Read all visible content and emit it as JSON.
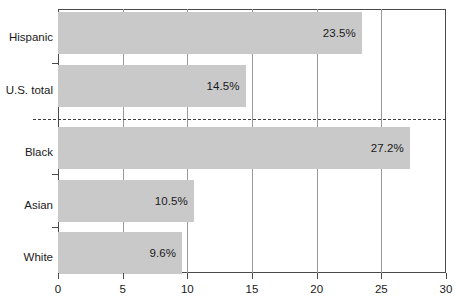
{
  "chart_data": {
    "type": "bar",
    "orientation": "horizontal",
    "title": "",
    "subtitle": "",
    "xlabel": "",
    "ylabel": "",
    "categories": [
      "Hispanic",
      "U.S. total",
      "Black",
      "Asian",
      "White"
    ],
    "values": [
      23.5,
      14.5,
      27.2,
      10.5,
      9.6
    ],
    "value_labels": [
      "23.5%",
      "14.5%",
      "27.2%",
      "10.5%",
      "9.6%"
    ],
    "xlim": [
      0,
      30
    ],
    "xticks": [
      0,
      5,
      10,
      15,
      20,
      25,
      30
    ],
    "xtick_labels": [
      "0",
      "5",
      "10",
      "15",
      "20",
      "25",
      "30"
    ],
    "grid": true,
    "grid_axis": "x",
    "legend": null,
    "annotations": [
      {
        "name": "group-separator",
        "type": "dashed-horizontal-line",
        "between": [
          "U.S. total",
          "Black"
        ]
      }
    ],
    "colors": {
      "bar_fill": "#c9c9c9",
      "axis": "#4a4a4a",
      "gridline": "#9a9a9a",
      "text": "#1a1a1a",
      "separator": "#3c3c3c",
      "background": "#ffffff"
    }
  }
}
